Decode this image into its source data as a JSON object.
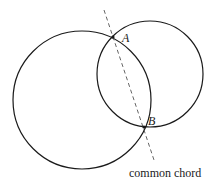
{
  "diagram": {
    "circles": [
      {
        "name": "left-circle",
        "cx": 82,
        "cy": 100,
        "r": 69
      },
      {
        "name": "right-circle",
        "cx": 150,
        "cy": 74,
        "r": 53
      }
    ],
    "points": [
      {
        "label": "A",
        "x": 113,
        "y": 37,
        "label_x": 122,
        "label_y": 42
      },
      {
        "label": "B",
        "x": 144,
        "y": 127,
        "label_x": 148,
        "label_y": 125
      }
    ],
    "chord_line": {
      "x1": 104,
      "y1": 10,
      "x2": 154,
      "y2": 160,
      "style": "dashed"
    },
    "caption": {
      "text": "common chord",
      "x": 129,
      "y": 177
    },
    "colors": {
      "stroke": "#1a1a1a",
      "dash": "#555555",
      "background": "#ffffff"
    }
  }
}
